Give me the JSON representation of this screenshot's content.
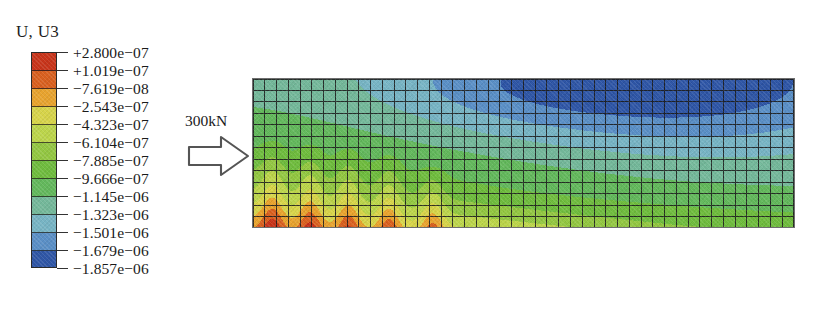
{
  "figure": {
    "type": "fea-contour-plot",
    "legend_title": "U, U3",
    "load_label": "300kN",
    "caption_partial": ""
  },
  "legend": {
    "title": "U, U3",
    "labels": [
      "+2.800e−07",
      "+1.019e−07",
      "−7.619e−08",
      "−2.543e−07",
      "−4.323e−07",
      "−6.104e−07",
      "−7.885e−07",
      "−9.666e−07",
      "−1.145e−06",
      "−1.323e−06",
      "−1.501e−06",
      "−1.679e−06",
      "−1.857e−06"
    ],
    "band_colors": [
      "#c8341a",
      "#d9601f",
      "#e8a32e",
      "#d7d44a",
      "#bcd54b",
      "#93c742",
      "#6fbc3e",
      "#63b85c",
      "#74b89a",
      "#77b4c4",
      "#5a8fc6",
      "#2f56a6",
      "#22357d"
    ]
  },
  "chart_data": {
    "type": "heatmap",
    "title": "U, U3",
    "xlabel": "",
    "ylabel": "",
    "grid": true,
    "legend_position": "left",
    "units": "m",
    "variable": "U3 (vertical displacement)",
    "colorbar_levels": [
      2.8e-07,
      1.019e-07,
      -7.619e-08,
      -2.543e-07,
      -4.323e-07,
      -6.104e-07,
      -7.885e-07,
      -9.666e-07,
      -1.145e-06,
      -1.323e-06,
      -1.501e-06,
      -1.679e-06,
      -1.857e-06
    ],
    "vmin": -1.857e-06,
    "vmax": 2.8e-07,
    "mesh_columns": 46,
    "mesh_rows": 13,
    "annotations": [
      {
        "text": "300kN",
        "position": "left-edge-mid",
        "marker": "block-arrow-right"
      }
    ],
    "field_description": "Vertical displacement contour over a rectangular meshed domain. Peak positive displacement (red) occurs as five flame-shaped spikes along the lower-left region near the load application point; values decrease through yellow and green across the mid-field; the most negative displacement (dark navy) occupies the upper-right region."
  },
  "colorbar_ticks_count": 13
}
